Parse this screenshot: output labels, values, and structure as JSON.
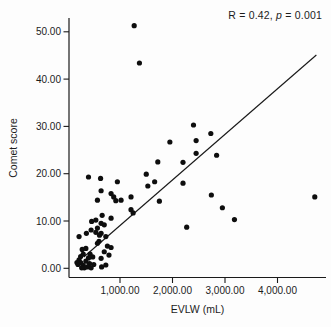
{
  "figure": {
    "annotation": {
      "prefix": "R = 0.42, ",
      "italic": "p",
      "suffix": " = 0.001"
    }
  },
  "chart_data": {
    "type": "scatter",
    "title": "",
    "xlabel": "EVLW (mL)",
    "ylabel": "Comet score",
    "annotation": "R = 0.42, p = 0.001",
    "xlim": [
      0,
      4900
    ],
    "ylim": [
      -1,
      53
    ],
    "grid": false,
    "legend": false,
    "x_ticks": [
      1000,
      2000,
      3000,
      4000
    ],
    "x_tick_labels": [
      "1,000.00",
      "2,000.00",
      "3,000.00",
      "4,000.00"
    ],
    "y_ticks": [
      0,
      10,
      20,
      30,
      40,
      50
    ],
    "y_tick_labels": [
      "0.00",
      "10.00",
      "20.00",
      "30.00",
      "40.00",
      "50.00"
    ],
    "point_color": "#0e0e0e",
    "line_color": "#1a1a1a",
    "regression_line": {
      "x1": 310,
      "y1": 2.4,
      "x2": 4740,
      "y2": 45.1
    },
    "points": [
      [
        1270,
        51.3
      ],
      [
        1370,
        43.4
      ],
      [
        2400,
        30.3
      ],
      [
        2730,
        28.5
      ],
      [
        2450,
        27.0
      ],
      [
        1950,
        26.7
      ],
      [
        2450,
        24.3
      ],
      [
        2840,
        23.9
      ],
      [
        1720,
        22.5
      ],
      [
        2200,
        22.4
      ],
      [
        1500,
        19.9
      ],
      [
        400,
        19.3
      ],
      [
        630,
        19.0
      ],
      [
        950,
        18.3
      ],
      [
        1660,
        18.3
      ],
      [
        2200,
        18.0
      ],
      [
        1530,
        17.4
      ],
      [
        640,
        16.4
      ],
      [
        830,
        15.8
      ],
      [
        880,
        15.1
      ],
      [
        1210,
        15.1
      ],
      [
        920,
        14.3
      ],
      [
        570,
        14.4
      ],
      [
        1020,
        14.4
      ],
      [
        1750,
        14.2
      ],
      [
        2740,
        15.5
      ],
      [
        4710,
        15.1
      ],
      [
        2950,
        12.8
      ],
      [
        3180,
        10.3
      ],
      [
        2270,
        8.7
      ],
      [
        1210,
        12.4
      ],
      [
        1250,
        11.7
      ],
      [
        830,
        10.6
      ],
      [
        660,
        11.2
      ],
      [
        540,
        10.2
      ],
      [
        460,
        9.9
      ],
      [
        640,
        9.5
      ],
      [
        700,
        9.2
      ],
      [
        570,
        8.5
      ],
      [
        450,
        8.1
      ],
      [
        360,
        7.4
      ],
      [
        640,
        7.4
      ],
      [
        540,
        7.6
      ],
      [
        610,
        7.0
      ],
      [
        730,
        6.7
      ],
      [
        220,
        6.7
      ],
      [
        600,
        5.7
      ],
      [
        570,
        5.3
      ],
      [
        760,
        4.7
      ],
      [
        830,
        4.4
      ],
      [
        700,
        3.5
      ],
      [
        790,
        2.8
      ],
      [
        640,
        2.1
      ],
      [
        730,
        0.7
      ],
      [
        650,
        0.3
      ],
      [
        350,
        4.2
      ],
      [
        280,
        4.0
      ],
      [
        430,
        3.0
      ],
      [
        300,
        3.0
      ],
      [
        250,
        2.5
      ],
      [
        480,
        2.4
      ],
      [
        400,
        2.2
      ],
      [
        220,
        1.8
      ],
      [
        350,
        1.5
      ],
      [
        250,
        1.2
      ],
      [
        180,
        1.2
      ],
      [
        420,
        1.0
      ],
      [
        200,
        0.8
      ],
      [
        500,
        0.8
      ],
      [
        300,
        0.6
      ],
      [
        380,
        0.3
      ],
      [
        320,
        0.1
      ],
      [
        270,
        0.1
      ],
      [
        450,
        0.1
      ]
    ]
  }
}
